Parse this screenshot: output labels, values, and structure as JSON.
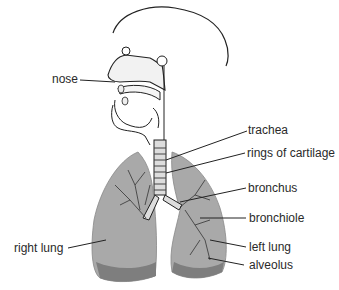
{
  "diagram": {
    "type": "anatomy",
    "labels": [
      {
        "id": "nose",
        "text": "nose"
      },
      {
        "id": "trachea",
        "text": "trachea"
      },
      {
        "id": "rings",
        "text": "rings of cartilage"
      },
      {
        "id": "bronchus",
        "text": "bronchus"
      },
      {
        "id": "bronchiole",
        "text": "bronchiole"
      },
      {
        "id": "left_lung",
        "text": "left lung"
      },
      {
        "id": "alveolus",
        "text": "alveolus"
      },
      {
        "id": "right_lung",
        "text": "right lung"
      }
    ],
    "colors": {
      "outline": "#222222",
      "lung_fill": "#a9a9a9",
      "lung_dark": "#7e7e7e",
      "label_text": "#2a2a2a"
    }
  }
}
